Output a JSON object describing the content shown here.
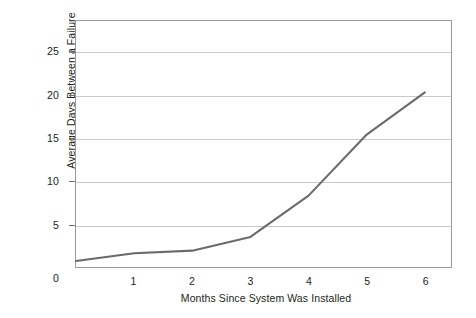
{
  "chart_data": {
    "type": "line",
    "title": "",
    "subtitle": "",
    "xlabel": "Months Since System Was Installed",
    "ylabel": "Average Days Between a Failure",
    "x": [
      0,
      1,
      2,
      3,
      4,
      5,
      6
    ],
    "values": [
      0.7,
      1.6,
      1.9,
      3.5,
      8.3,
      15.4,
      20.3
    ],
    "series": [
      {
        "name": "Average Days Between a Failure",
        "values": [
          0.7,
          1.6,
          1.9,
          3.5,
          8.3,
          15.4,
          20.3
        ]
      }
    ],
    "xlim": [
      0,
      6.45
    ],
    "ylim": [
      0,
      28.6
    ],
    "xticks": [
      0,
      1,
      2,
      3,
      4,
      5,
      6
    ],
    "xtick_labels": [
      "0",
      "1",
      "2",
      "3",
      "4",
      "5",
      "6"
    ],
    "yticks": [
      5,
      10,
      15,
      20,
      25
    ],
    "ytick_labels": [
      "5",
      "10",
      "15",
      "20",
      "25"
    ],
    "ytick_label_zero": "0",
    "grid": "horizontal",
    "legend": "none",
    "markers": "none",
    "line_color": "#6b6b6b",
    "grid_color": "#c9c9c9",
    "frame_color": "#9a9a9a",
    "background_color": "#ffffff",
    "text_color": "#231f20"
  }
}
